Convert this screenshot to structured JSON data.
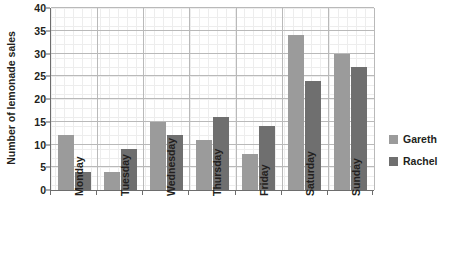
{
  "chart_data": {
    "type": "bar",
    "title": "",
    "xlabel": "",
    "ylabel": "Number of lemonade sales",
    "categories": [
      "Monday",
      "Tuesday",
      "Wednesday",
      "Thursday",
      "Friday",
      "Saturday",
      "Sunday"
    ],
    "series": [
      {
        "name": "Gareth",
        "color": "#9b9b9b",
        "values": [
          12,
          4,
          15,
          11,
          8,
          34,
          30
        ]
      },
      {
        "name": "Rachel",
        "color": "#6f6f6f",
        "values": [
          4,
          9,
          12,
          16,
          14,
          24,
          27
        ]
      }
    ],
    "ylim": [
      0,
      40
    ],
    "ytick_labels": [
      "0",
      "5",
      "10",
      "15",
      "20",
      "25",
      "30",
      "35",
      "40"
    ],
    "ytick_values": [
      0,
      5,
      10,
      15,
      20,
      25,
      30,
      35,
      40
    ],
    "grid": true,
    "grid_minor": true,
    "legend_position": "right"
  },
  "legend": {
    "items": [
      {
        "label": "Gareth",
        "color": "#9b9b9b"
      },
      {
        "label": "Rachel",
        "color": "#6f6f6f"
      }
    ]
  },
  "colors": {
    "gareth": "#9b9b9b",
    "rachel": "#6f6f6f",
    "axis": "#6d6d6d",
    "grid_major": "#b9b9b9",
    "grid_minor": "#ededed",
    "text": "#231f20",
    "background": "#ffffff"
  }
}
